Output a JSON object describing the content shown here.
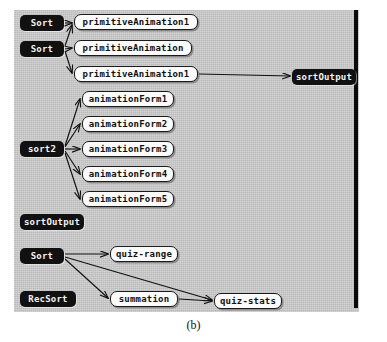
{
  "figure": {
    "caption": "(b)",
    "panel_color": "#c9c9c9",
    "rule_color": "#0b0b0b",
    "dark_node_bg": "#111111",
    "dark_node_fg": "#f2f2f2",
    "light_node_bg": "#fbfbfb",
    "light_node_fg": "#111111",
    "edge_color": "#101010"
  },
  "diagram": {
    "type": "node-link-graph",
    "nodes": [
      {
        "id": "sort_a",
        "label": "Sort",
        "style": "dark",
        "x": 6,
        "y": 5,
        "w": 44
      },
      {
        "id": "sort_b",
        "label": "Sort",
        "style": "dark",
        "x": 6,
        "y": 31,
        "w": 44
      },
      {
        "id": "prim1",
        "label": "primitiveAnimation1",
        "style": "light",
        "x": 60,
        "y": 4,
        "w": 124
      },
      {
        "id": "prim2",
        "label": "primitiveAnimation",
        "style": "light",
        "x": 60,
        "y": 30,
        "w": 118
      },
      {
        "id": "prim3",
        "label": "primitiveAnimation1",
        "style": "light",
        "x": 60,
        "y": 56,
        "w": 124
      },
      {
        "id": "sortout_r",
        "label": "sortOutput",
        "style": "dark",
        "x": 278,
        "y": 59,
        "w": 64
      },
      {
        "id": "sort2",
        "label": "sort2",
        "style": "dark",
        "x": 6,
        "y": 131,
        "w": 44
      },
      {
        "id": "af1",
        "label": "animationForm1",
        "style": "light",
        "x": 68,
        "y": 81,
        "w": 92
      },
      {
        "id": "af2",
        "label": "animationForm2",
        "style": "light",
        "x": 68,
        "y": 106,
        "w": 92
      },
      {
        "id": "af3",
        "label": "animationForm3",
        "style": "light",
        "x": 68,
        "y": 131,
        "w": 92
      },
      {
        "id": "af4",
        "label": "animationForm4",
        "style": "light",
        "x": 68,
        "y": 156,
        "w": 92
      },
      {
        "id": "af5",
        "label": "animationForm5",
        "style": "light",
        "x": 68,
        "y": 181,
        "w": 92
      },
      {
        "id": "sortout_l",
        "label": "sortOutput",
        "style": "dark",
        "x": 6,
        "y": 204,
        "w": 64
      },
      {
        "id": "sort_c",
        "label": "Sort",
        "style": "dark",
        "x": 6,
        "y": 238,
        "w": 44
      },
      {
        "id": "recsort",
        "label": "RecSort",
        "style": "dark",
        "x": 6,
        "y": 281,
        "w": 56
      },
      {
        "id": "quizrange",
        "label": "quiz-range",
        "style": "light",
        "x": 96,
        "y": 236,
        "w": 68
      },
      {
        "id": "summation",
        "label": "summation",
        "style": "light",
        "x": 96,
        "y": 281,
        "w": 68
      },
      {
        "id": "quizstats",
        "label": "quiz-stats",
        "style": "light",
        "x": 200,
        "y": 283,
        "w": 68
      }
    ],
    "edges": [
      {
        "from": "sort_a",
        "to": "prim1"
      },
      {
        "from": "sort_b",
        "to": "prim1"
      },
      {
        "from": "sort_b",
        "to": "prim2"
      },
      {
        "from": "sort_b",
        "to": "prim3"
      },
      {
        "from": "prim3",
        "to": "sortout_r"
      },
      {
        "from": "sort2",
        "to": "af1"
      },
      {
        "from": "sort2",
        "to": "af2"
      },
      {
        "from": "sort2",
        "to": "af3"
      },
      {
        "from": "sort2",
        "to": "af4"
      },
      {
        "from": "sort2",
        "to": "af5"
      },
      {
        "from": "sort_c",
        "to": "quizrange"
      },
      {
        "from": "sort_c",
        "to": "summation"
      },
      {
        "from": "sort_c",
        "to": "quizstats"
      },
      {
        "from": "summation",
        "to": "quizstats"
      }
    ]
  }
}
